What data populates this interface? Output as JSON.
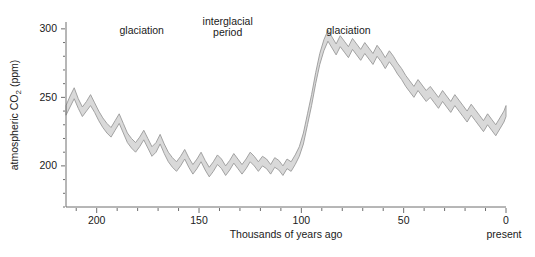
{
  "chart_data": {
    "type": "area",
    "title": "",
    "xlabel": "Thousands of years ago",
    "ylabel": "atmospheric CO₂ (ppm)",
    "ylabel_plain": "atmospheric CO",
    "ylabel_sub": "2",
    "ylabel_unit": " (ppm)",
    "xlim": [
      215,
      0
    ],
    "ylim": [
      170,
      305
    ],
    "x_major_ticks": [
      200,
      150,
      100,
      50,
      0
    ],
    "x_major_tick_labels": [
      "200",
      "150",
      "100",
      "50",
      "0"
    ],
    "x_minor_tick_step": 10,
    "y_major_ticks": [
      200,
      250,
      300
    ],
    "y_major_tick_labels": [
      "200",
      "250",
      "300"
    ],
    "y_minor_tick_step": 10,
    "grid": false,
    "legend": "none",
    "x_axis_end_label": "present",
    "series_style": "uncertainty band (upper/lower envelope)",
    "annotations": [
      {
        "id": "glaciation-left",
        "text": "glaciation",
        "x_kya": 178,
        "y_ppm": 296
      },
      {
        "id": "interglacial",
        "text_line1": "interglacial",
        "text_line2": "period",
        "x_kya": 136,
        "y_ppm": 303
      },
      {
        "id": "glaciation-right",
        "text": "glaciation",
        "x_kya": 77,
        "y_ppm": 296
      }
    ],
    "x": [
      215,
      213,
      211,
      209,
      207,
      205,
      203,
      201,
      199,
      197,
      195,
      193,
      191,
      189,
      187,
      185,
      183,
      181,
      179,
      177,
      175,
      173,
      171,
      169,
      167,
      165,
      163,
      161,
      159,
      157,
      155,
      153,
      151,
      149,
      147,
      145,
      143,
      141,
      139,
      137,
      135,
      133,
      131,
      129,
      127,
      125,
      123,
      121,
      119,
      117,
      115,
      113,
      111,
      109,
      107,
      105,
      103,
      101,
      99,
      97,
      95,
      93,
      91,
      89,
      87,
      85,
      83,
      81,
      79,
      77,
      75,
      73,
      71,
      69,
      67,
      65,
      63,
      61,
      59,
      57,
      55,
      53,
      51,
      49,
      47,
      45,
      43,
      41,
      39,
      37,
      35,
      33,
      31,
      29,
      27,
      25,
      23,
      21,
      19,
      17,
      15,
      13,
      11,
      9,
      7,
      5,
      3,
      1,
      0
    ],
    "upper_ppm": [
      244,
      251,
      257,
      249,
      243,
      247,
      252,
      246,
      240,
      235,
      231,
      228,
      233,
      238,
      231,
      224,
      220,
      217,
      221,
      226,
      220,
      214,
      217,
      223,
      216,
      210,
      206,
      203,
      207,
      212,
      206,
      201,
      205,
      210,
      204,
      199,
      203,
      208,
      205,
      200,
      204,
      209,
      205,
      201,
      205,
      210,
      207,
      203,
      207,
      205,
      201,
      206,
      204,
      200,
      205,
      203,
      208,
      214,
      224,
      238,
      252,
      268,
      282,
      292,
      299,
      294,
      289,
      295,
      291,
      287,
      293,
      289,
      285,
      290,
      286,
      282,
      288,
      284,
      279,
      284,
      280,
      275,
      271,
      266,
      262,
      258,
      263,
      259,
      255,
      258,
      254,
      250,
      255,
      251,
      247,
      252,
      248,
      244,
      240,
      245,
      241,
      237,
      233,
      238,
      234,
      230,
      235,
      240,
      244
    ],
    "lower_ppm": [
      237,
      243,
      249,
      242,
      236,
      240,
      244,
      239,
      233,
      228,
      224,
      221,
      226,
      231,
      224,
      217,
      213,
      210,
      214,
      219,
      213,
      207,
      210,
      216,
      209,
      203,
      199,
      196,
      200,
      205,
      199,
      194,
      198,
      203,
      197,
      192,
      196,
      201,
      198,
      193,
      197,
      202,
      198,
      194,
      198,
      203,
      200,
      196,
      200,
      198,
      194,
      199,
      197,
      193,
      198,
      196,
      201,
      207,
      216,
      230,
      244,
      260,
      274,
      284,
      291,
      286,
      281,
      287,
      283,
      279,
      285,
      281,
      277,
      282,
      278,
      274,
      280,
      276,
      271,
      276,
      272,
      267,
      263,
      258,
      254,
      250,
      255,
      251,
      247,
      250,
      246,
      242,
      247,
      243,
      239,
      244,
      240,
      236,
      232,
      237,
      233,
      229,
      225,
      230,
      226,
      222,
      227,
      232,
      236
    ]
  },
  "figure": {
    "name": "atmospheric-co2-ice-core-record"
  }
}
